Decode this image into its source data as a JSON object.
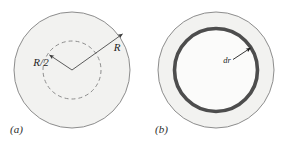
{
  "figure": {
    "background_color": "#ffffff",
    "panels": [
      {
        "id": "panel-a",
        "caption": "(a)",
        "description": "Large shaded disk with a dashed inner circle of half radius; two radius arrows drawn from the center.",
        "disk": {
          "center_x": 72,
          "center_y": 70,
          "radius": 58,
          "fill_color": "#f2f2f0",
          "stroke_color": "#8d8d8d"
        },
        "inner_dashed_circle": {
          "center_x": 72,
          "center_y": 70,
          "radius": 29,
          "fill_color": "none",
          "stroke_color": "#8d8d8d",
          "dash_pattern": "4 3"
        },
        "annotations": [
          {
            "name": "radius-half-arrow",
            "label": "R/2",
            "label_x": 41,
            "label_y": 66,
            "from_x": 72,
            "from_y": 70,
            "to_x": 48,
            "to_y": 54,
            "stroke_color": "#4a4a4a"
          },
          {
            "name": "radius-full-arrow",
            "label": "R",
            "label_x": 117,
            "label_y": 50,
            "from_x": 72,
            "from_y": 70,
            "to_x": 124,
            "to_y": 33,
            "stroke_color": "#4a4a4a"
          }
        ]
      },
      {
        "id": "panel-b",
        "caption": "(b)",
        "description": "Large shaded disk containing a thick dark annular ring of thickness dr; region inside the ring is unshaded.",
        "disk": {
          "center_x": 216,
          "center_y": 70,
          "radius": 58,
          "fill_color": "#f2f2f0",
          "stroke_color": "#8d8d8d"
        },
        "inner_disk": {
          "center_x": 216,
          "center_y": 70,
          "radius": 40,
          "fill_color": "#fbfbfa"
        },
        "ring": {
          "center_x": 216,
          "center_y": 70,
          "radius": 41.5,
          "thickness": 3.6,
          "stroke_color": "#4d4d4d"
        },
        "annotations": [
          {
            "name": "ring-thickness-arrow",
            "label": "dr",
            "label_x": 232,
            "label_y": 63,
            "from_x": 232,
            "from_y": 60,
            "to_x": 252,
            "to_y": 47,
            "stroke_color": "#1f1f1f"
          }
        ]
      }
    ]
  }
}
